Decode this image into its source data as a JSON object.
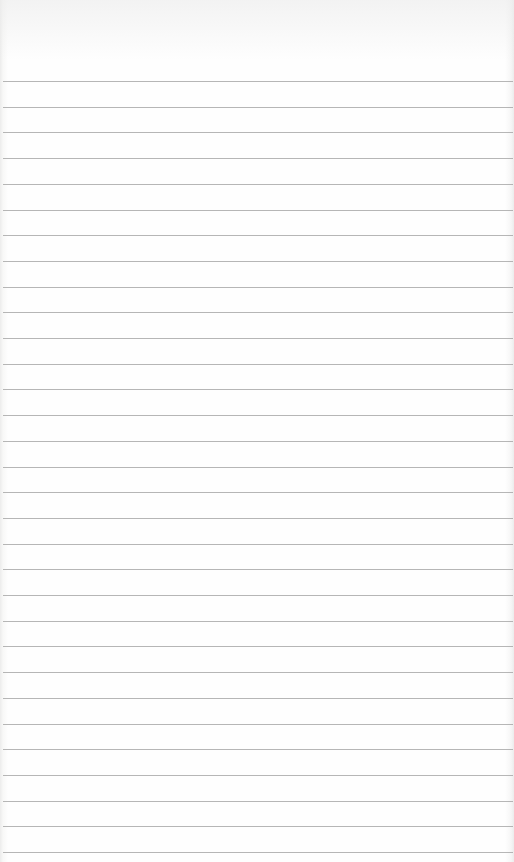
{
  "page": {
    "type": "lined-paper",
    "rule_color": "#a9a9a9",
    "background_color": "#fdfdfc",
    "rule_count": 31,
    "first_rule_y": 81,
    "rule_spacing": 25.7
  }
}
